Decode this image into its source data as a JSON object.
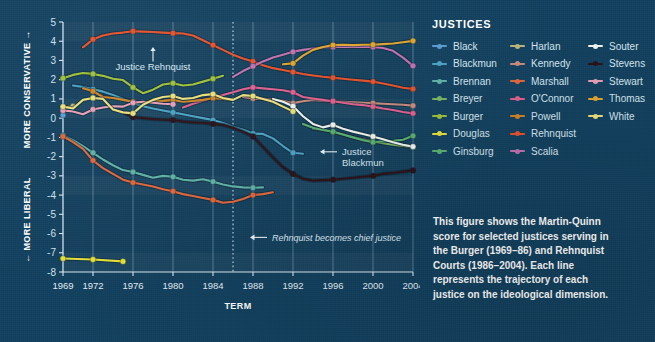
{
  "legend": {
    "title": "JUSTICES",
    "columns": [
      [
        {
          "name": "Black",
          "color": "#5a9bd5"
        },
        {
          "name": "Blackmun",
          "color": "#4aa3c4"
        },
        {
          "name": "Brennan",
          "color": "#5fb3a8"
        },
        {
          "name": "Breyer",
          "color": "#7bb661"
        },
        {
          "name": "Burger",
          "color": "#9dc13a"
        },
        {
          "name": "Douglas",
          "color": "#e8e239"
        },
        {
          "name": "Ginsburg",
          "color": "#58b070"
        }
      ],
      [
        {
          "name": "Harlan",
          "color": "#bdb77a"
        },
        {
          "name": "Kennedy",
          "color": "#c98b7e"
        },
        {
          "name": "Marshall",
          "color": "#e2673b"
        },
        {
          "name": "O'Connor",
          "color": "#e0608f"
        },
        {
          "name": "Powell",
          "color": "#cf8523"
        },
        {
          "name": "Rehnquist",
          "color": "#e8512b"
        },
        {
          "name": "Scalia",
          "color": "#c islands"
        }
      ],
      [
        {
          "name": "Souter",
          "color": "#f2f6f0"
        },
        {
          "name": "Stevens",
          "color": "#2a0f16"
        },
        {
          "name": "Stewart",
          "color": "#e8a0b8"
        },
        {
          "name": "Thomas",
          "color": "#e0a52e"
        },
        {
          "name": "White",
          "color": "#ece17a"
        }
      ]
    ]
  },
  "caption": {
    "lines": [
      "This figure shows the Martin-Quinn",
      "score for selected justices serving in",
      "the Burger (1969–86) and Rehnquist",
      "Courts (1986–2004). Each line",
      "represents the trajectory of each",
      "justice on the ideological dimension."
    ]
  },
  "chart_data": {
    "type": "line",
    "title": "",
    "xlabel": "TERM",
    "ylabel_top": "MORE CONSERVATIVE →",
    "ylabel_bottom": "← MORE LIBERAL",
    "xlim": [
      1969,
      2004
    ],
    "ylim": [
      -8,
      5
    ],
    "yticks": [
      5,
      4,
      3,
      2,
      1,
      0,
      -1,
      -2,
      -3,
      -4,
      -5,
      -6,
      -7,
      -8
    ],
    "xticks": [
      1969,
      1972,
      1976,
      1980,
      1984,
      1988,
      1992,
      1996,
      2000,
      2004
    ],
    "grid": true,
    "legend_position": "right",
    "annotations": [
      {
        "name": "justice-rehnquist-annotation",
        "text": "Justice Rehnquist",
        "x": 1978,
        "y": 3.0,
        "arrow": "up"
      },
      {
        "name": "justice-blackmun-annotation",
        "text": "Justice\nBlackmun",
        "x": 1995,
        "y": -1.75,
        "arrow": "left"
      },
      {
        "name": "rehnquist-chief-annotation",
        "text": "Rehnquist becomes chief justice",
        "x": 1988,
        "y": -6.2,
        "arrow": "left"
      }
    ],
    "vline": {
      "name": "rehnquist-chief-vline",
      "x": 1986,
      "style": "dotted"
    },
    "series": [
      {
        "name": "Black",
        "color": "#5a9bd5",
        "x": [
          1969
        ],
        "values": [
          0.15
        ]
      },
      {
        "name": "Blackmun",
        "color": "#4aa3c4",
        "x": [
          1970,
          1971,
          1972,
          1973,
          1974,
          1975,
          1976,
          1977,
          1978,
          1979,
          1980,
          1981,
          1982,
          1983,
          1984,
          1985,
          1986,
          1987,
          1988,
          1989,
          1990,
          1991,
          1992,
          1993
        ],
        "values": [
          1.7,
          1.62,
          1.5,
          1.38,
          1.2,
          1.0,
          0.8,
          0.62,
          0.5,
          0.4,
          0.3,
          0.2,
          0.1,
          0.0,
          -0.1,
          -0.25,
          -0.45,
          -0.6,
          -0.8,
          -0.82,
          -1.05,
          -1.45,
          -1.8,
          -1.85
        ]
      },
      {
        "name": "Brennan",
        "color": "#5fb3a8",
        "x": [
          1969,
          1970,
          1971,
          1972,
          1973,
          1974,
          1975,
          1976,
          1977,
          1978,
          1979,
          1980,
          1981,
          1982,
          1983,
          1984,
          1985,
          1986,
          1987,
          1988,
          1989
        ],
        "values": [
          -0.9,
          -1.15,
          -1.45,
          -1.8,
          -2.15,
          -2.45,
          -2.7,
          -2.8,
          -2.95,
          -3.1,
          -3.0,
          -3.05,
          -3.2,
          -3.25,
          -3.18,
          -3.3,
          -3.45,
          -3.55,
          -3.6,
          -3.62,
          -3.6
        ]
      },
      {
        "name": "Breyer",
        "color": "#7bb661",
        "x": [
          1994,
          1995,
          1996,
          1997,
          1998,
          1999,
          2000,
          2001,
          2002,
          2003,
          2004
        ],
        "values": [
          -0.55,
          -0.6,
          -0.72,
          -0.85,
          -1.0,
          -1.1,
          -1.22,
          -1.3,
          -1.38,
          -1.45,
          -1.5
        ]
      },
      {
        "name": "Burger",
        "color": "#9dc13a",
        "x": [
          1969,
          1970,
          1971,
          1972,
          1973,
          1974,
          1975,
          1976,
          1977,
          1978,
          1979,
          1980,
          1981,
          1982,
          1983,
          1984,
          1985
        ],
        "values": [
          2.08,
          2.25,
          2.35,
          2.3,
          2.2,
          2.05,
          1.98,
          1.6,
          1.3,
          1.48,
          1.75,
          1.82,
          1.7,
          1.75,
          1.9,
          2.05,
          2.2
        ]
      },
      {
        "name": "Douglas",
        "color": "#e8e239",
        "x": [
          1969,
          1972,
          1975
        ],
        "values": [
          -7.3,
          -7.35,
          -7.45
        ]
      },
      {
        "name": "Ginsburg",
        "color": "#58b070",
        "x": [
          1993,
          1994,
          1995,
          1996,
          1997,
          1998,
          1999,
          2000,
          2001,
          2002,
          2003,
          2004
        ],
        "values": [
          -0.3,
          -0.5,
          -0.62,
          -0.7,
          -0.85,
          -1.0,
          -1.15,
          -1.25,
          -1.2,
          -1.18,
          -1.12,
          -0.92
        ]
      },
      {
        "name": "Harlan",
        "color": "#bdb77a",
        "x": [
          1969,
          1970
        ],
        "values": [
          0.55,
          0.62
        ]
      },
      {
        "name": "Kennedy",
        "color": "#c98b7e",
        "x": [
          1987,
          1988,
          1989,
          1990,
          1991,
          1992,
          1993,
          1994,
          1995,
          1996,
          1997,
          1998,
          1999,
          2000,
          2001,
          2002,
          2003,
          2004
        ],
        "values": [
          1.1,
          1.02,
          1.0,
          0.95,
          0.9,
          0.78,
          0.88,
          0.95,
          0.9,
          0.88,
          0.85,
          0.82,
          0.8,
          0.78,
          0.75,
          0.72,
          0.7,
          0.65
        ]
      },
      {
        "name": "Marshall",
        "color": "#e2673b",
        "x": [
          1969,
          1970,
          1971,
          1972,
          1973,
          1974,
          1975,
          1976,
          1977,
          1978,
          1979,
          1980,
          1981,
          1982,
          1983,
          1984,
          1985,
          1986,
          1987,
          1988,
          1989,
          1990
        ],
        "values": [
          -0.95,
          -1.25,
          -1.6,
          -2.2,
          -2.6,
          -2.9,
          -3.2,
          -3.35,
          -3.45,
          -3.55,
          -3.7,
          -3.8,
          -3.95,
          -4.05,
          -4.15,
          -4.25,
          -4.4,
          -4.35,
          -4.2,
          -4.0,
          -3.95,
          -3.85
        ]
      },
      {
        "name": "O'Connor",
        "color": "#e0608f",
        "x": [
          1981,
          1982,
          1983,
          1984,
          1985,
          1986,
          1987,
          1988,
          1989,
          1990,
          1991,
          1992,
          1993,
          1994,
          1995,
          1996,
          1997,
          1998,
          1999,
          2000,
          2001,
          2002,
          2003,
          2004
        ],
        "values": [
          0.55,
          0.75,
          0.9,
          1.05,
          1.2,
          1.35,
          1.5,
          1.6,
          1.55,
          1.5,
          1.45,
          1.35,
          1.1,
          1.02,
          0.95,
          0.88,
          0.8,
          0.72,
          0.68,
          0.6,
          0.5,
          0.42,
          0.32,
          0.25
        ]
      },
      {
        "name": "Powell",
        "color": "#cf8523",
        "x": [
          1971,
          1972,
          1973,
          1974,
          1975,
          1976,
          1977,
          1978,
          1979,
          1980,
          1981,
          1982,
          1983,
          1984,
          1985,
          1986
        ],
        "values": [
          1.55,
          1.4,
          1.1,
          1.05,
          0.95,
          0.85,
          0.8,
          0.88,
          0.9,
          0.95,
          0.85,
          0.9,
          0.95,
          1.05,
          1.0,
          0.95
        ]
      },
      {
        "name": "Rehnquist",
        "color": "#e8512b",
        "x": [
          1971,
          1972,
          1973,
          1974,
          1975,
          1976,
          1977,
          1978,
          1979,
          1980,
          1981,
          1982,
          1983,
          1984,
          1985,
          1986,
          1987,
          1988,
          1989,
          1990,
          1991,
          1992,
          1993,
          1994,
          1995,
          1996,
          1997,
          1998,
          1999,
          2000,
          2001,
          2002,
          2003,
          2004
        ],
        "values": [
          3.68,
          4.1,
          4.3,
          4.4,
          4.45,
          4.52,
          4.5,
          4.48,
          4.45,
          4.42,
          4.4,
          4.3,
          4.05,
          3.8,
          3.55,
          3.3,
          3.1,
          2.95,
          2.75,
          2.6,
          2.5,
          2.4,
          2.3,
          2.22,
          2.15,
          2.1,
          2.05,
          2.0,
          1.95,
          1.9,
          1.8,
          1.7,
          1.58,
          1.52
        ]
      },
      {
        "name": "Scalia",
        "color": "#c071b0",
        "x": [
          1986,
          1987,
          1988,
          1989,
          1990,
          1991,
          1992,
          1993,
          1994,
          1995,
          1996,
          1997,
          1998,
          1999,
          2000,
          2001,
          2002,
          2003,
          2004
        ],
        "values": [
          2.15,
          2.45,
          2.7,
          2.95,
          3.15,
          3.3,
          3.45,
          3.55,
          3.62,
          3.68,
          3.7,
          3.72,
          3.7,
          3.72,
          3.7,
          3.65,
          3.5,
          3.15,
          2.72
        ]
      },
      {
        "name": "Souter",
        "color": "#f2f6f0",
        "x": [
          1990,
          1991,
          1992,
          1993,
          1994,
          1995,
          1996,
          1997,
          1998,
          1999,
          2000,
          2001,
          2002,
          2003,
          2004
        ],
        "values": [
          1.0,
          0.85,
          0.62,
          0.1,
          -0.3,
          -0.48,
          -0.35,
          -0.55,
          -0.7,
          -0.82,
          -0.95,
          -1.1,
          -1.25,
          -1.38,
          -1.48
        ]
      },
      {
        "name": "Stevens",
        "color": "#2a0f16",
        "x": [
          1975,
          1976,
          1977,
          1978,
          1979,
          1980,
          1981,
          1982,
          1983,
          1984,
          1985,
          1986,
          1987,
          1988,
          1989,
          1990,
          1991,
          1992,
          1993,
          1994,
          1995,
          1996,
          1997,
          1998,
          1999,
          2000,
          2001,
          2002,
          2003,
          2004
        ],
        "values": [
          0.3,
          0.05,
          0.0,
          -0.05,
          -0.08,
          -0.1,
          -0.18,
          -0.22,
          -0.25,
          -0.3,
          -0.35,
          -0.5,
          -0.7,
          -0.95,
          -1.5,
          -2.05,
          -2.55,
          -2.9,
          -3.15,
          -3.25,
          -3.22,
          -3.2,
          -3.15,
          -3.1,
          -3.05,
          -3.0,
          -2.9,
          -2.85,
          -2.78,
          -2.72
        ]
      },
      {
        "name": "Stewart",
        "color": "#e8a0b8",
        "x": [
          1969,
          1970,
          1971,
          1972,
          1973,
          1974,
          1975,
          1976,
          1977,
          1978,
          1979,
          1980
        ],
        "values": [
          0.4,
          0.35,
          0.2,
          0.45,
          0.55,
          0.62,
          0.6,
          0.8,
          0.85,
          0.8,
          0.75,
          0.72
        ]
      },
      {
        "name": "Thomas",
        "color": "#e0a52e",
        "x": [
          1991,
          1992,
          1993,
          1994,
          1995,
          1996,
          1997,
          1998,
          1999,
          2000,
          2001,
          2002,
          2003,
          2004
        ],
        "values": [
          2.8,
          2.85,
          3.25,
          3.55,
          3.7,
          3.8,
          3.82,
          3.8,
          3.82,
          3.82,
          3.85,
          3.88,
          3.95,
          4.02
        ]
      },
      {
        "name": "White",
        "color": "#ece17a",
        "x": [
          1969,
          1970,
          1971,
          1972,
          1973,
          1974,
          1975,
          1976,
          1977,
          1978,
          1979,
          1980,
          1981,
          1982,
          1983,
          1984,
          1985,
          1986,
          1987,
          1988,
          1989,
          1990,
          1991,
          1992
        ],
        "values": [
          0.6,
          0.5,
          0.95,
          1.05,
          1.0,
          0.45,
          0.3,
          0.25,
          0.7,
          0.95,
          1.1,
          1.15,
          1.0,
          1.05,
          1.2,
          1.25,
          1.05,
          0.95,
          1.2,
          1.15,
          1.0,
          0.85,
          0.6,
          0.35
        ]
      }
    ]
  }
}
